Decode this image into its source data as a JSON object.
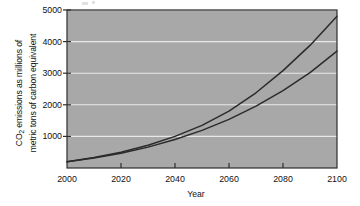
{
  "chart_data": {
    "type": "line",
    "title": "",
    "xlabel": "Year",
    "ylabel_line1": "CO2 emissions as millions of",
    "ylabel_line2": "metric tons of carbon equivalent",
    "ylabel_full": "CO2 emissions as millions of metric tons of carbon equivalent",
    "xlim": [
      2000,
      2100
    ],
    "ylim": [
      0,
      5000
    ],
    "xticks": [
      2000,
      2020,
      2040,
      2060,
      2080,
      2100
    ],
    "yticks": [
      1000,
      2000,
      3000,
      4000,
      5000
    ],
    "xtick_labels": [
      "2000",
      "2020",
      "2040",
      "2060",
      "2080",
      "2100"
    ],
    "ytick_labels": [
      "1000",
      "2000",
      "3000",
      "4000",
      "5000"
    ],
    "grid": true,
    "grid_color": "#e8e8e8",
    "plot_background": "#a8a8a8",
    "line_color": "#2b2b2b",
    "legend": "annotations",
    "x": [
      2000,
      2010,
      2020,
      2030,
      2040,
      2050,
      2060,
      2070,
      2080,
      2090,
      2100
    ],
    "series": [
      {
        "name": "Medium level of urbanization",
        "values": [
          200,
          330,
          500,
          720,
          1000,
          1350,
          1800,
          2380,
          3080,
          3880,
          4800
        ]
      },
      {
        "name": "Low level of urbanization",
        "values": [
          200,
          320,
          470,
          660,
          900,
          1190,
          1540,
          1960,
          2450,
          3020,
          3700
        ]
      }
    ],
    "annotations": [
      {
        "name": "medium-level-annotation",
        "line1": "Medium level of",
        "line2": "urbanization",
        "x_px": 205,
        "y_px": 80
      },
      {
        "name": "low-level-annotation",
        "line1": "Low level of",
        "line2": "urbanization",
        "x_px": 277,
        "y_px": 112
      }
    ]
  }
}
